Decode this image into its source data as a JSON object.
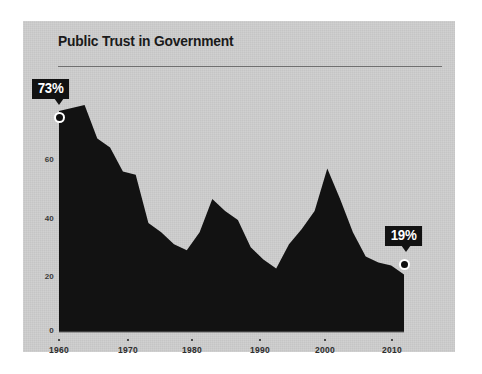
{
  "card": {
    "background_color": "#cdcdcd",
    "page_background_color": "#ffffff"
  },
  "header": {
    "title": "Public Trust in Government"
  },
  "annotations": [
    {
      "name": "peak-callout",
      "label": "73%",
      "year": 1960,
      "value": 73
    },
    {
      "name": "latest-callout",
      "label": "19%",
      "year": 2014,
      "value": 19
    }
  ],
  "axes": {
    "y_ticks": [
      "0",
      "20",
      "40",
      "60"
    ],
    "x_ticks": [
      "1960",
      "1970",
      "1980",
      "1990",
      "2000",
      "2010"
    ]
  },
  "chart_data": {
    "type": "area",
    "title": "Public Trust in Government",
    "xlabel": "",
    "ylabel": "",
    "xlim": [
      1960,
      2014
    ],
    "ylim": [
      0,
      78
    ],
    "grid": false,
    "legend": "none",
    "series_color": "#121212",
    "x": [
      1960,
      1962,
      1964,
      1966,
      1968,
      1970,
      1972,
      1974,
      1976,
      1978,
      1980,
      1982,
      1984,
      1986,
      1988,
      1990,
      1992,
      1994,
      1996,
      1998,
      2000,
      2002,
      2004,
      2006,
      2008,
      2010,
      2012,
      2014
    ],
    "values": [
      73,
      74,
      75,
      64,
      61,
      53,
      52,
      36,
      33,
      29,
      27,
      33,
      44,
      40,
      37,
      28,
      24,
      21,
      29,
      34,
      40,
      54,
      44,
      33,
      25,
      23,
      22,
      19
    ],
    "annotations": [
      {
        "label": "73%",
        "x": 1960,
        "y": 73
      },
      {
        "label": "19%",
        "x": 2014,
        "y": 19
      }
    ]
  }
}
